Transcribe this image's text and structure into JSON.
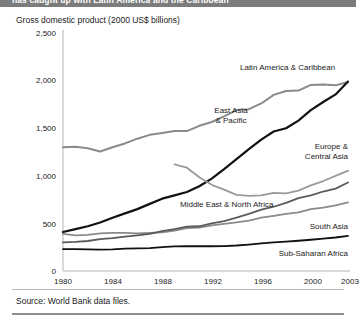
{
  "figure": {
    "title": "has caught up with Latin America and the Caribbean",
    "subtitle": "Gross domestic product (2000 US$ billions)",
    "source": "Source: World Bank data files."
  },
  "chart_data": {
    "type": "line",
    "title": "has caught up with Latin America and the Caribbean",
    "subtitle": "Gross domestic product (2000 US$ billions)",
    "xlabel": "",
    "ylabel": "Gross domestic product (2000 US$ billions)",
    "xlim": [
      1980,
      2003
    ],
    "ylim": [
      0,
      2500
    ],
    "yticks": [
      0,
      500,
      1000,
      1500,
      2000,
      2500
    ],
    "ytick_labels": [
      "0",
      "500",
      "1,000",
      "1,500",
      "2,000",
      "2,500"
    ],
    "xticks": [
      1980,
      1984,
      1988,
      1992,
      1996,
      2000,
      2003
    ],
    "xtick_labels": [
      "1980",
      "1984",
      "1988",
      "1992",
      "1996",
      "2000",
      "2003"
    ],
    "grid": false,
    "legend_position": "inline-annotations",
    "x": [
      1980,
      1981,
      1982,
      1983,
      1984,
      1985,
      1986,
      1987,
      1988,
      1989,
      1990,
      1991,
      1992,
      1993,
      1994,
      1995,
      1996,
      1997,
      1998,
      1999,
      2000,
      2001,
      2002,
      2003
    ],
    "series": [
      {
        "name": "Latin America & Caribbean",
        "color": "#8a8a8a",
        "width": 2.0,
        "values": [
          1300,
          1305,
          1290,
          1255,
          1300,
          1340,
          1390,
          1430,
          1450,
          1470,
          1470,
          1525,
          1565,
          1625,
          1690,
          1700,
          1760,
          1850,
          1890,
          1895,
          1955,
          1960,
          1950,
          1985
        ]
      },
      {
        "name": "East Asia & Pacific",
        "color": "#111111",
        "width": 2.2,
        "values": [
          410,
          440,
          470,
          510,
          560,
          605,
          650,
          705,
          760,
          795,
          830,
          890,
          970,
          1070,
          1175,
          1280,
          1380,
          1465,
          1500,
          1580,
          1690,
          1775,
          1855,
          1990
        ]
      },
      {
        "name": "Europe & Central Asia",
        "color": "#9a9a9a",
        "width": 1.8,
        "values": [
          null,
          null,
          null,
          null,
          null,
          null,
          null,
          null,
          null,
          1120,
          1085,
          985,
          905,
          855,
          800,
          790,
          795,
          820,
          815,
          845,
          900,
          945,
          1000,
          1055
        ]
      },
      {
        "name": "Middle East & North Africa",
        "color": "#8a8a8a",
        "width": 1.8,
        "values": [
          390,
          375,
          380,
          395,
          400,
          400,
          395,
          400,
          405,
          425,
          450,
          455,
          480,
          495,
          510,
          530,
          560,
          580,
          600,
          615,
          650,
          665,
          690,
          720
        ]
      },
      {
        "name": "South Asia",
        "color": "#5a5a5a",
        "width": 1.8,
        "values": [
          300,
          305,
          315,
          335,
          345,
          360,
          375,
          390,
          420,
          440,
          465,
          470,
          500,
          525,
          560,
          600,
          645,
          675,
          715,
          765,
          795,
          835,
          865,
          930
        ]
      },
      {
        "name": "Sub-Saharan Africa",
        "color": "#111111",
        "width": 1.8,
        "values": [
          230,
          230,
          228,
          225,
          228,
          235,
          238,
          240,
          250,
          258,
          260,
          262,
          260,
          262,
          268,
          278,
          290,
          300,
          308,
          318,
          328,
          340,
          352,
          368
        ]
      }
    ],
    "annotations": [
      {
        "label": "Latin America & Caribbean",
        "x": 1994,
        "y": 2150
      },
      {
        "label": "East Asia\n& Pacific",
        "x": 1991,
        "y": 1370
      },
      {
        "label": "Europe &\nCentral Asia",
        "x": 2001,
        "y": 1180
      },
      {
        "label": "Middle East & North Africa",
        "x": 1993,
        "y": 700
      },
      {
        "label": "South Asia",
        "x": 2002,
        "y": 560
      },
      {
        "label": "Sub-Saharan Africa",
        "x": 2001,
        "y": 300
      }
    ]
  },
  "annotations": {
    "latin_america": "Latin America & Caribbean",
    "east_asia_1": "East Asia",
    "east_asia_2": "& Pacific",
    "europe_1": "Europe &",
    "europe_2": "Central Asia",
    "middle_east": "Middle East & North Africa",
    "south_asia": "South Asia",
    "sub_saharan": "Sub-Saharan Africa"
  },
  "axes": {
    "y_labels": [
      "2,500",
      "2,000",
      "1,500",
      "1,000",
      "500",
      "0"
    ],
    "x_labels": [
      "1980",
      "1984",
      "1988",
      "1992",
      "1996",
      "2000",
      "2003"
    ]
  }
}
